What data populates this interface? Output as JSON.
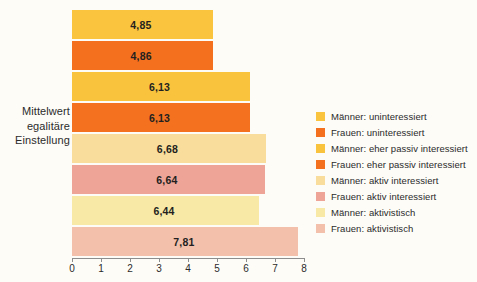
{
  "chart_data": {
    "type": "bar",
    "orientation": "horizontal",
    "title": "",
    "xlabel": "",
    "ylabel": "Mittelwert egalitäre Einstellung",
    "ylabel_lines": [
      "Mittelwert",
      "egalitäre",
      "Einstellung"
    ],
    "xlim": [
      0,
      8
    ],
    "xticks": [
      0,
      1,
      2,
      3,
      4,
      5,
      6,
      7,
      8
    ],
    "xtick_labels": [
      "0",
      "1",
      "2",
      "3",
      "4",
      "5",
      "6",
      "7",
      "8"
    ],
    "grid": false,
    "legend_position": "right",
    "categories": [
      "Männer: uninteressiert",
      "Frauen: uninteressiert",
      "Männer: eher passiv interessiert",
      "Frauen: eher passiv interessiert",
      "Männer: aktiv interessiert",
      "Frauen: aktiv interessiert",
      "Männer: aktivistisch",
      "Frauen: aktivistisch"
    ],
    "values": [
      4.85,
      4.86,
      6.13,
      6.13,
      6.68,
      6.64,
      6.44,
      7.81
    ],
    "value_labels": [
      "4,85",
      "4,86",
      "6,13",
      "6,13",
      "6,68",
      "6,64",
      "6,44",
      "7,81"
    ],
    "colors": [
      "#f9c23c",
      "#f4751f",
      "#f9c githubA",
      "#f4751f",
      "#f8dd9a",
      "#eda394",
      "#f9eaa3",
      "#f3bfa9"
    ],
    "bars": [
      {
        "label": "Männer: uninteressiert",
        "value": 4.85,
        "value_label": "4,85",
        "color": "#fac43e"
      },
      {
        "label": "Frauen: uninteressiert",
        "value": 4.86,
        "value_label": "4,86",
        "color": "#f4701f"
      },
      {
        "label": "Männer: eher passiv interessiert",
        "value": 6.13,
        "value_label": "6,13",
        "color": "#fac33d"
      },
      {
        "label": "Frauen: eher passiv interessiert",
        "value": 6.13,
        "value_label": "6,13",
        "color": "#f4721f"
      },
      {
        "label": "Männer: aktiv interessiert",
        "value": 6.68,
        "value_label": "6,68",
        "color": "#f9dd9c"
      },
      {
        "label": "Frauen: aktiv interessiert",
        "value": 6.64,
        "value_label": "6,64",
        "color": "#eea497"
      },
      {
        "label": "Männer: aktivistisch",
        "value": 6.44,
        "value_label": "6,44",
        "color": "#f8e9a6"
      },
      {
        "label": "Frauen: aktivistisch",
        "value": 7.81,
        "value_label": "7,81",
        "color": "#f3c0ab"
      }
    ]
  },
  "legend": {
    "items": [
      {
        "label": "Männer: uninteressiert",
        "color": "#fac43e"
      },
      {
        "label": "Frauen: uninteressiert",
        "color": "#f4701f"
      },
      {
        "label": "Männer: eher passiv interessiert",
        "color": "#fac33d"
      },
      {
        "label": "Frauen: eher passiv interessiert",
        "color": "#f4721f"
      },
      {
        "label": "Männer: aktiv interessiert",
        "color": "#f9dd9c"
      },
      {
        "label": "Frauen: aktiv interessiert",
        "color": "#eea497"
      },
      {
        "label": "Männer: aktivistisch",
        "color": "#f8e9a6"
      },
      {
        "label": "Frauen: aktivistisch",
        "color": "#f3c0ab"
      }
    ]
  }
}
